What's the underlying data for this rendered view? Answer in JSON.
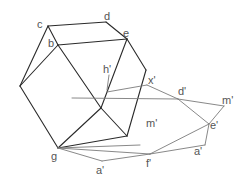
{
  "diagram": {
    "title": "",
    "labels": {
      "c": "c",
      "d": "d",
      "b": "b",
      "e": "e",
      "h_prime": "h'",
      "x_prime": "x'",
      "d_prime": "d'",
      "m_prime_right": "m'",
      "m_prime_center": "m'",
      "e_prime": "e'",
      "a_prime_right": "a'",
      "f_prime": "f'",
      "g": "g",
      "a_prime_bottom": "a'"
    },
    "colors": {
      "solid_edges": "#2a2a2a",
      "projection_edges": "#7a7a7a",
      "label_text": "#555555",
      "background": "#ffffff"
    }
  }
}
